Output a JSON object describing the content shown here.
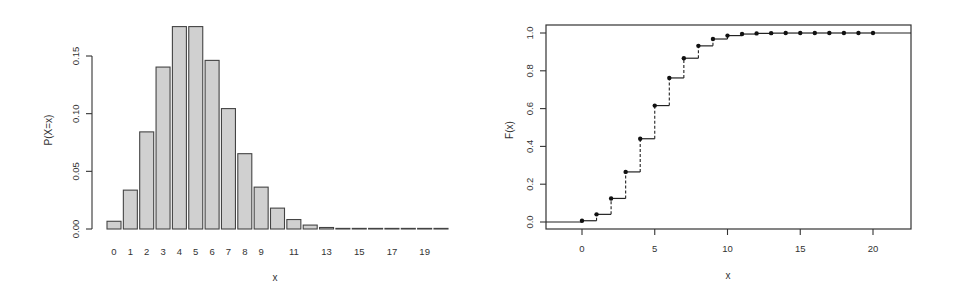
{
  "chart_data": [
    {
      "type": "bar",
      "title": "",
      "xlabel": "x",
      "ylabel": "P(X=x)",
      "categories": [
        0,
        1,
        2,
        3,
        4,
        5,
        6,
        7,
        8,
        9,
        10,
        11,
        12,
        13,
        14,
        15,
        16,
        17,
        18,
        19,
        20
      ],
      "x_tick_labels": [
        "0",
        "1",
        "2",
        "3",
        "4",
        "5",
        "6",
        "7",
        "8",
        "9",
        "11",
        "13",
        "15",
        "17",
        "19"
      ],
      "x_tick_label_positions": [
        0,
        1,
        2,
        3,
        4,
        5,
        6,
        7,
        8,
        9,
        11,
        13,
        15,
        17,
        19
      ],
      "values": [
        0.0067,
        0.0337,
        0.0842,
        0.1404,
        0.1755,
        0.1755,
        0.1462,
        0.1044,
        0.0653,
        0.0363,
        0.0181,
        0.0082,
        0.0034,
        0.0013,
        0.0005,
        0.0002,
        0.0,
        0.0,
        0.0,
        0.0,
        0.0
      ],
      "y_ticks": [
        0.0,
        0.05,
        0.1,
        0.15
      ],
      "y_tick_labels": [
        "0.00",
        "0.05",
        "0.10",
        "0.15"
      ],
      "ylim": [
        0,
        0.18
      ],
      "grid": false,
      "legend": null,
      "bar_fill": "#d0d0d0",
      "bar_stroke": "#444444"
    },
    {
      "type": "line",
      "subtype": "step",
      "title": "",
      "xlabel": "x",
      "ylabel": "F(x)",
      "x": [
        0,
        1,
        2,
        3,
        4,
        5,
        6,
        7,
        8,
        9,
        10,
        11,
        12,
        13,
        14,
        15,
        16,
        17,
        18,
        19,
        20
      ],
      "values": [
        0.0067,
        0.0404,
        0.1247,
        0.265,
        0.4405,
        0.616,
        0.7622,
        0.8666,
        0.9319,
        0.9682,
        0.9863,
        0.9945,
        0.998,
        0.9993,
        0.9998,
        0.9999,
        1.0,
        1.0,
        1.0,
        1.0,
        1.0
      ],
      "x_ticks": [
        0,
        5,
        10,
        15,
        20
      ],
      "x_tick_labels": [
        "0",
        "5",
        "10",
        "15",
        "20"
      ],
      "y_ticks": [
        0.0,
        0.2,
        0.4,
        0.6,
        0.8,
        1.0
      ],
      "y_tick_labels": [
        "0.0",
        "0.2",
        "0.4",
        "0.6",
        "0.8",
        "1.0"
      ],
      "xlim": [
        -2.5,
        22.6
      ],
      "ylim": [
        -0.04,
        1.04
      ],
      "grid": false,
      "legend": null,
      "line_color": "#222222",
      "point_color": "#111111",
      "vertical_connector_style": "dashed"
    }
  ]
}
